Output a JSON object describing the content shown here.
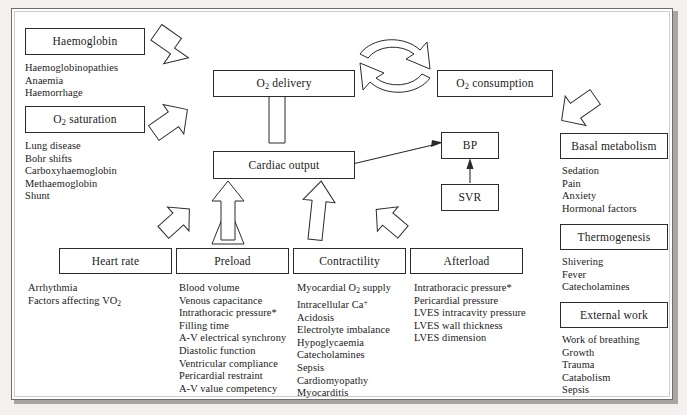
{
  "diagram": {
    "nodes": {
      "haemoglobin": "Haemoglobin",
      "o2_saturation": "O₂ saturation",
      "o2_delivery": "O₂ delivery",
      "o2_consumption": "O₂ consumption",
      "cardiac_output": "Cardiac output",
      "bp": "BP",
      "svr": "SVR",
      "heart_rate": "Heart rate",
      "preload": "Preload",
      "contractility": "Contractility",
      "afterload": "Afterload",
      "basal_metabolism": "Basal metabolism",
      "thermogenesis": "Thermogenesis",
      "external_work": "External work"
    },
    "lists": {
      "haemoglobin": [
        "Haemoglobinopathies",
        "Anaemia",
        "Haemorrhage"
      ],
      "o2_saturation": [
        "Lung disease",
        "Bohr shifts",
        "Carboxyhaemoglobin",
        "Methaemoglobin",
        "Shunt"
      ],
      "heart_rate": [
        "Arrhythmia",
        "Factors affecting VO₂"
      ],
      "preload": [
        "Blood volume",
        "Venous capacitance",
        "Intrathoracic pressure*",
        "Filling time",
        "A-V electrical synchrony",
        "Diastolic function",
        "Ventricular compliance",
        "Pericardial restraint",
        "A-V value competency"
      ],
      "contractility": [
        "Myocardial O₂ supply",
        "Intracellular Ca⁺",
        "Acidosis",
        "Electrolyte imbalance",
        "Hypoglycaemia",
        "Catecholamines",
        "Sepsis",
        "Cardiomyopathy",
        "Myocarditis"
      ],
      "afterload": [
        "Intrathoracic pressure*",
        "Pericardial pressure",
        "LVES intracavity pressure",
        "LVES wall thickness",
        "LVES dimension"
      ],
      "basal_metabolism": [
        "Sedation",
        "Pain",
        "Anxiety",
        "Hormonal factors"
      ],
      "thermogenesis": [
        "Shivering",
        "Fever",
        "Catecholamines"
      ],
      "external_work": [
        "Work of breathing",
        "Growth",
        "Trauma",
        "Catabolism",
        "Sepsis"
      ]
    },
    "colors": {
      "ink": "#2b2b2b",
      "page": "#ffffff",
      "background": "#f2f1ef",
      "shadow": "#a8a6a3"
    }
  }
}
